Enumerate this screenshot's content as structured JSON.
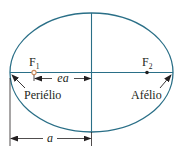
{
  "diagram": {
    "colors": {
      "orbit": "#2a6f87",
      "axes": "#2a6f87",
      "dimension": "#231f20",
      "focus1": "#c8885a",
      "focus2": "#231f20",
      "text": "#231f20"
    },
    "labels": {
      "focus1": {
        "main": "F",
        "sub": "1"
      },
      "focus2": {
        "main": "F",
        "sub": "2"
      },
      "ea": "ea",
      "a": "a",
      "perihelion": "Periélio",
      "aphelion": "Afélio"
    }
  }
}
